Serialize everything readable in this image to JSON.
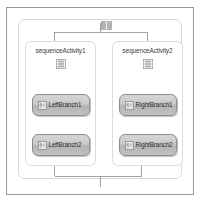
{
  "designer": {
    "surface_name": "workflow-design-surface",
    "root_activity": {
      "name": "parallelActivity",
      "icon": "parallel-activity-icon"
    },
    "branches": [
      {
        "label": "sequenceActivity1",
        "icon": "sequence-activity-icon",
        "activities": [
          {
            "label": "LeftBranch1",
            "icon": "code-activity-icon"
          },
          {
            "label": "LeftBranch2",
            "icon": "code-activity-icon"
          }
        ]
      },
      {
        "label": "sequenceActivity2",
        "icon": "sequence-activity-icon",
        "activities": [
          {
            "label": "RightBranch1",
            "icon": "code-activity-icon"
          },
          {
            "label": "RightBranch2",
            "icon": "code-activity-icon"
          }
        ]
      }
    ]
  },
  "colors": {
    "canvas_background": "#ffffff",
    "frame_border": "#9a9a9a",
    "container_border": "#d8d8d8",
    "activity_border": "#8e8e8e",
    "activity_fill_top": "#d6d6d6",
    "activity_fill_bottom": "#b4b4b4",
    "connector_line": "#8c8c8c",
    "label_text": "#3a3a3a"
  }
}
